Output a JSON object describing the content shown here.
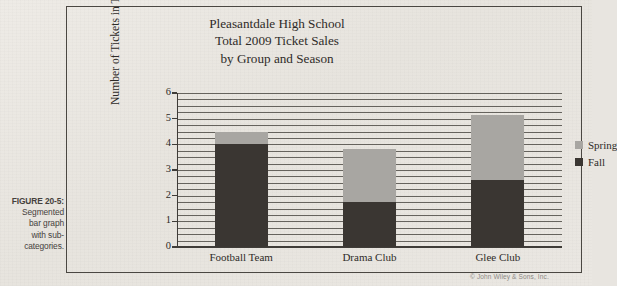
{
  "caption": {
    "figure_label": "FIGURE 20-5:",
    "lines": [
      "Segmented",
      "bar graph",
      "with sub-",
      "categories."
    ]
  },
  "copyright": "© John Wiley & Sons, Inc.",
  "legend": {
    "title": "",
    "items": [
      {
        "label": "Spring",
        "color": "#a8a6a2"
      },
      {
        "label": "Fall",
        "color": "#3a3632"
      }
    ]
  },
  "chart_data": {
    "type": "bar",
    "stacked": true,
    "title": "Pleasantdale High School\nTotal 2009 Ticket Sales\nby Group and Season",
    "title_lines": [
      "Pleasantdale High School",
      "Total 2009 Ticket Sales",
      "by Group and Season"
    ],
    "xlabel": "",
    "ylabel": "Number of Tickets in Thousands",
    "ylim": [
      0,
      6
    ],
    "yticks": [
      0,
      1,
      2,
      3,
      4,
      5,
      6
    ],
    "ytick_labels": [
      "0",
      "1",
      "2",
      "3",
      "4",
      "5",
      "6"
    ],
    "grid": true,
    "minor_gridlines_per_unit": 4,
    "legend_position": "right",
    "categories": [
      "Football Team",
      "Drama Club",
      "Glee Club"
    ],
    "series": [
      {
        "name": "Fall",
        "color": "#3a3632",
        "values": [
          4.0,
          1.75,
          2.6
        ]
      },
      {
        "name": "Spring",
        "color": "#a8a6a2",
        "values": [
          0.5,
          2.05,
          2.55
        ]
      }
    ],
    "totals": [
      4.5,
      3.8,
      5.15
    ]
  }
}
